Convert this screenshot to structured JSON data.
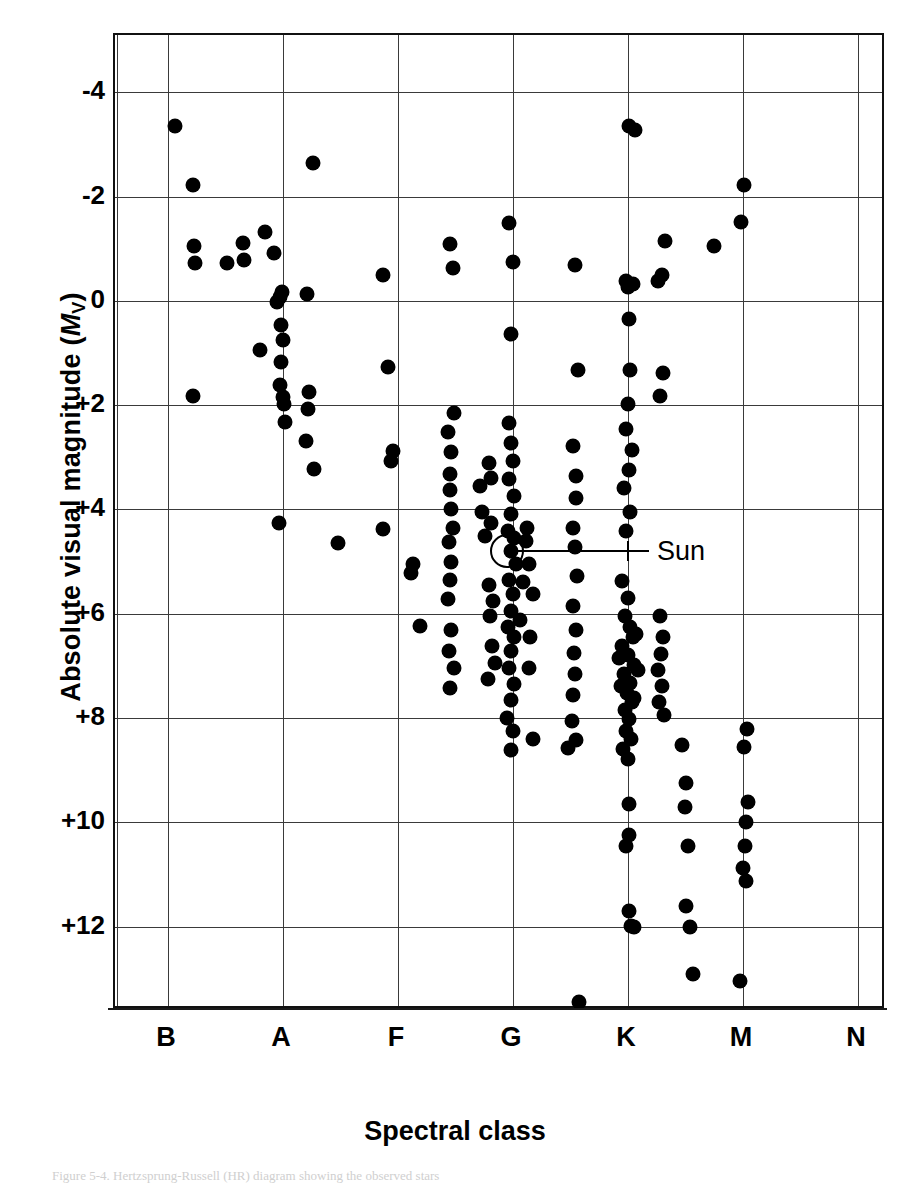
{
  "figure": {
    "title_y": "Absolute visual magnitude (",
    "title_y_symbol": "M",
    "title_y_sub": "V",
    "title_y_close": ")",
    "title_x": "Spectral class",
    "caption": "Figure 5-4.  Hertzsprung-Russell (HR) diagram showing the observed stars"
  },
  "annotations": [
    {
      "name": "sun",
      "label": "Sun",
      "x_class": "G",
      "magnitude": 4.8
    }
  ],
  "chart_data": {
    "type": "scatter",
    "title": "",
    "xlabel": "Spectral class",
    "ylabel": "Absolute visual magnitude (M_V)",
    "x_categories": [
      "B",
      "A",
      "F",
      "G",
      "K",
      "M",
      "N"
    ],
    "x_tick_px": [
      166,
      281,
      396,
      511,
      626,
      741,
      856
    ],
    "y_ticks": [
      "-4",
      "-2",
      "0",
      "+2",
      "+4",
      "+6",
      "+8",
      "+10",
      "+12"
    ],
    "y_tick_values": [
      -4,
      -2,
      0,
      2,
      4,
      6,
      8,
      10,
      12
    ],
    "ylim": [
      -5.1,
      13.6
    ],
    "y_axis_inverted": true,
    "grid": true,
    "legend": null,
    "vertical_gridlines_px": [
      166,
      281,
      396,
      511,
      626,
      741,
      856
    ],
    "extra_gridline_px": [
      115
    ],
    "points": [
      [
        173,
        -3.35
      ],
      [
        191,
        -2.22
      ],
      [
        192,
        -1.05
      ],
      [
        193,
        -0.72
      ],
      [
        225,
        -0.72
      ],
      [
        191,
        1.82
      ],
      [
        242,
        -0.78
      ],
      [
        241,
        -1.12
      ],
      [
        263,
        -1.32
      ],
      [
        272,
        -0.92
      ],
      [
        278,
        -0.07
      ],
      [
        275,
        0.02
      ],
      [
        279,
        0.46
      ],
      [
        280,
        -0.18
      ],
      [
        305,
        -0.13
      ],
      [
        279,
        1.17
      ],
      [
        281,
        0.75
      ],
      [
        278,
        1.62
      ],
      [
        281,
        1.85
      ],
      [
        283,
        2.33
      ],
      [
        306,
        2.08
      ],
      [
        307,
        1.75
      ],
      [
        304,
        2.68
      ],
      [
        312,
        3.22
      ],
      [
        277,
        4.25
      ],
      [
        336,
        4.65
      ],
      [
        311,
        -2.65
      ],
      [
        282,
        1.98
      ],
      [
        258,
        0.95
      ],
      [
        381,
        -0.5
      ],
      [
        386,
        1.27
      ],
      [
        389,
        3.07
      ],
      [
        391,
        2.87
      ],
      [
        381,
        4.37
      ],
      [
        411,
        5.05
      ],
      [
        409,
        5.22
      ],
      [
        418,
        6.23
      ],
      [
        448,
        -1.1
      ],
      [
        451,
        -0.63
      ],
      [
        446,
        2.52
      ],
      [
        448,
        3.32
      ],
      [
        448,
        3.62
      ],
      [
        449,
        4.0
      ],
      [
        451,
        4.35
      ],
      [
        447,
        4.62
      ],
      [
        449,
        5.0
      ],
      [
        448,
        5.35
      ],
      [
        446,
        5.72
      ],
      [
        449,
        6.32
      ],
      [
        447,
        6.72
      ],
      [
        452,
        7.05
      ],
      [
        448,
        7.42
      ],
      [
        478,
        3.55
      ],
      [
        480,
        4.05
      ],
      [
        483,
        4.5
      ],
      [
        489,
        4.25
      ],
      [
        507,
        -1.5
      ],
      [
        511,
        -0.75
      ],
      [
        509,
        0.63
      ],
      [
        507,
        2.35
      ],
      [
        509,
        2.72
      ],
      [
        511,
        3.08
      ],
      [
        507,
        3.42
      ],
      [
        512,
        3.75
      ],
      [
        509,
        4.08
      ],
      [
        506,
        4.42
      ],
      [
        512,
        4.55
      ],
      [
        509,
        4.8
      ],
      [
        514,
        5.05
      ],
      [
        507,
        5.35
      ],
      [
        511,
        5.62
      ],
      [
        509,
        5.95
      ],
      [
        506,
        6.25
      ],
      [
        512,
        6.45
      ],
      [
        509,
        6.72
      ],
      [
        507,
        7.05
      ],
      [
        512,
        7.35
      ],
      [
        509,
        7.65
      ],
      [
        505,
        8.0
      ],
      [
        511,
        8.25
      ],
      [
        509,
        8.62
      ],
      [
        487,
        3.1
      ],
      [
        489,
        3.4
      ],
      [
        487,
        5.45
      ],
      [
        491,
        5.75
      ],
      [
        488,
        6.05
      ],
      [
        490,
        6.62
      ],
      [
        493,
        6.95
      ],
      [
        486,
        7.25
      ],
      [
        524,
        4.6
      ],
      [
        527,
        5.05
      ],
      [
        521,
        5.4
      ],
      [
        525,
        4.35
      ],
      [
        531,
        5.62
      ],
      [
        518,
        6.12
      ],
      [
        528,
        6.45
      ],
      [
        573,
        -0.68
      ],
      [
        576,
        1.32
      ],
      [
        571,
        2.78
      ],
      [
        574,
        3.35
      ],
      [
        574,
        3.78
      ],
      [
        571,
        4.35
      ],
      [
        573,
        4.72
      ],
      [
        575,
        5.28
      ],
      [
        571,
        5.85
      ],
      [
        574,
        6.32
      ],
      [
        572,
        6.75
      ],
      [
        573,
        7.15
      ],
      [
        571,
        7.55
      ],
      [
        570,
        8.05
      ],
      [
        574,
        8.42
      ],
      [
        566,
        8.58
      ],
      [
        627,
        -3.35
      ],
      [
        633,
        -3.28
      ],
      [
        624,
        -0.38
      ],
      [
        631,
        -0.32
      ],
      [
        627,
        0.35
      ],
      [
        626,
        -0.27
      ],
      [
        628,
        1.32
      ],
      [
        626,
        1.98
      ],
      [
        624,
        2.45
      ],
      [
        630,
        2.85
      ],
      [
        627,
        3.25
      ],
      [
        622,
        3.58
      ],
      [
        628,
        4.05
      ],
      [
        624,
        4.42
      ],
      [
        620,
        5.38
      ],
      [
        626,
        5.7
      ],
      [
        623,
        6.05
      ],
      [
        628,
        6.25
      ],
      [
        631,
        6.45
      ],
      [
        620,
        6.62
      ],
      [
        626,
        6.8
      ],
      [
        632,
        6.98
      ],
      [
        622,
        7.15
      ],
      [
        628,
        7.32
      ],
      [
        625,
        7.52
      ],
      [
        630,
        7.7
      ],
      [
        623,
        7.85
      ],
      [
        627,
        8.02
      ],
      [
        624,
        8.25
      ],
      [
        629,
        8.4
      ],
      [
        621,
        8.6
      ],
      [
        626,
        8.78
      ],
      [
        634,
        6.38
      ],
      [
        617,
        6.85
      ],
      [
        636,
        7.08
      ],
      [
        632,
        7.62
      ],
      [
        619,
        7.38
      ],
      [
        627,
        9.65
      ],
      [
        624,
        10.45
      ],
      [
        627,
        11.7
      ],
      [
        629,
        11.98
      ],
      [
        632,
        12.0
      ],
      [
        627,
        10.25
      ],
      [
        656,
        -0.38
      ],
      [
        658,
        1.82
      ],
      [
        661,
        1.38
      ],
      [
        658,
        6.05
      ],
      [
        661,
        6.45
      ],
      [
        659,
        6.78
      ],
      [
        656,
        7.08
      ],
      [
        660,
        7.38
      ],
      [
        657,
        7.7
      ],
      [
        662,
        7.95
      ],
      [
        680,
        8.52
      ],
      [
        684,
        9.25
      ],
      [
        683,
        9.7
      ],
      [
        686,
        10.45
      ],
      [
        684,
        11.6
      ],
      [
        688,
        12.0
      ],
      [
        691,
        12.9
      ],
      [
        742,
        -2.22
      ],
      [
        739,
        -1.52
      ],
      [
        712,
        -1.05
      ],
      [
        745,
        8.22
      ],
      [
        742,
        8.55
      ],
      [
        746,
        9.62
      ],
      [
        744,
        10.0
      ],
      [
        743,
        10.45
      ],
      [
        741,
        10.88
      ],
      [
        744,
        11.12
      ],
      [
        738,
        13.05
      ],
      [
        577,
        13.45
      ],
      [
        660,
        -0.5
      ],
      [
        663,
        -1.15
      ],
      [
        527,
        7.05
      ],
      [
        531,
        8.4
      ],
      [
        449,
        2.9
      ],
      [
        452,
        2.15
      ]
    ]
  }
}
